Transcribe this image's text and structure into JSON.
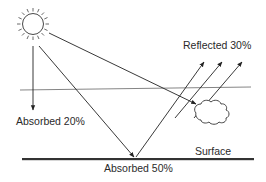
{
  "diagram": {
    "labels": {
      "reflected": "Reflected 30%",
      "absorbed_atmosphere": "Absorbed 20%",
      "surface": "Surface",
      "absorbed_surface": "Absorbed 50%"
    },
    "elements": {
      "sun": "sun-icon",
      "cloud": "cloud-icon",
      "atmosphere_line": "atmosphere-boundary",
      "surface_line": "ground-surface"
    },
    "colors": {
      "line": "#222222",
      "atmosphere_line": "#666666",
      "surface": "#333333",
      "text": "#2a2a2a"
    }
  }
}
